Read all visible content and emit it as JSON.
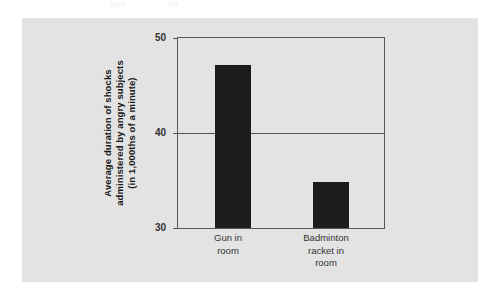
{
  "figure": {
    "background_color": "#e3e3e3",
    "page_background_color": "#ffffff",
    "bar_color": "#1c1c1c",
    "axis_color": "#555555"
  },
  "chart_data": {
    "type": "bar",
    "title": "",
    "subtitle": "",
    "xlabel": "",
    "ylabel": "Average duration of shocks administered by angry subjects (in 1,000ths of a minute)",
    "ylabel_lines": [
      "Average duration of shocks",
      "administered by angry subjects",
      "(in 1,000ths of a minute)"
    ],
    "categories": [
      "Gun in room",
      "Badminton racket in room"
    ],
    "category_label_lines": [
      [
        "Gun in",
        "room"
      ],
      [
        "Badminton",
        "racket in",
        "room"
      ]
    ],
    "values": [
      47.2,
      34.8
    ],
    "ylim": [
      30,
      50
    ],
    "yticks": [
      30,
      40,
      50
    ],
    "ytick_labels": [
      "30",
      "40",
      "50"
    ],
    "gridlines": [
      40
    ],
    "grid": true,
    "legend": null,
    "legend_position": "none",
    "annotations": []
  }
}
